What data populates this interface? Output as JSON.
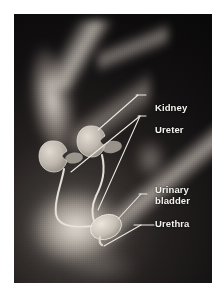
{
  "figure": {
    "kind": "anatomical-illustration",
    "background_color": "#0d0d0e",
    "label_color": "#f2f2ee",
    "leader_line_color": "#e8e6e0",
    "organ_fill_color": "#cfc9c0",
    "page_background": "#ffffff"
  },
  "labels": [
    {
      "id": "kidney",
      "text": "Kidney"
    },
    {
      "id": "ureter",
      "text": "Ureter"
    },
    {
      "id": "bladder",
      "text": "Urinary\nbladder"
    },
    {
      "id": "urethra",
      "text": "Urethra"
    }
  ]
}
